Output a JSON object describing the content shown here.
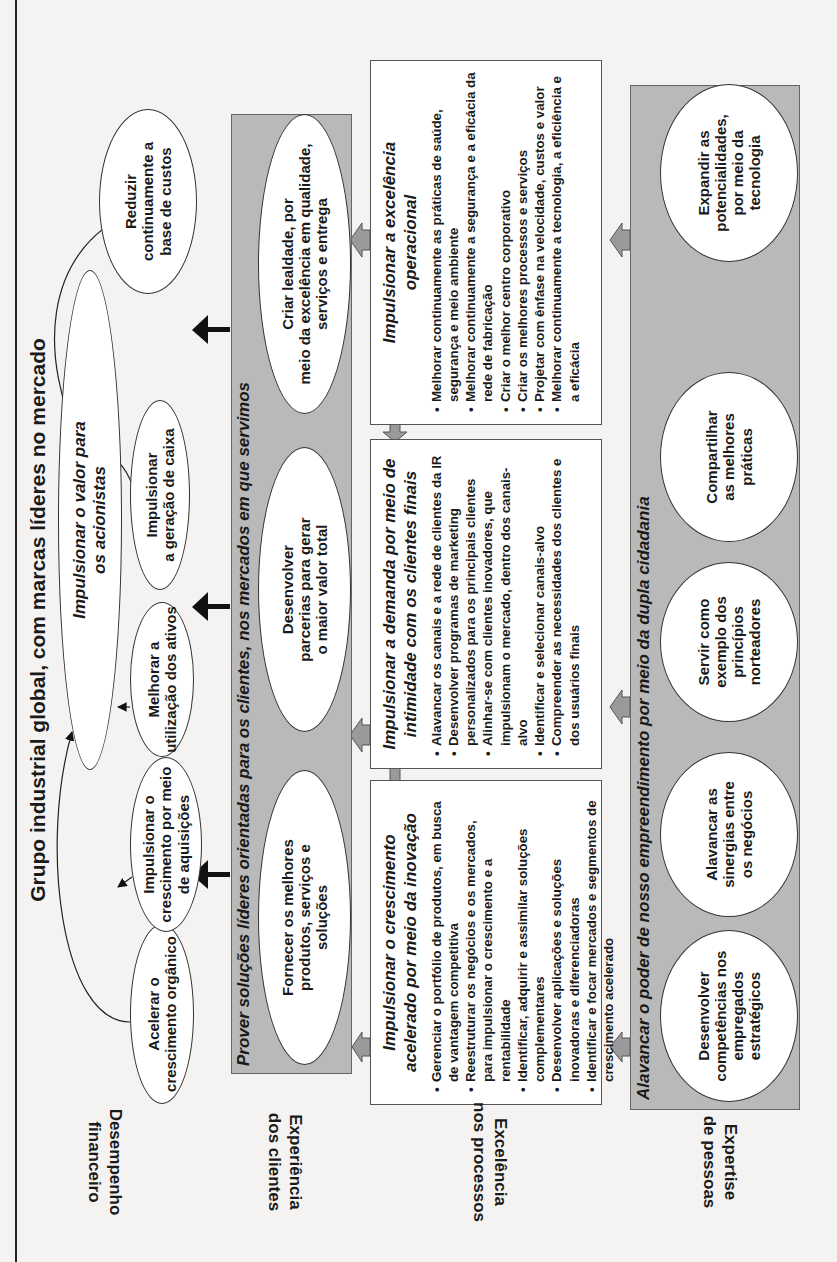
{
  "title": "Grupo industrial global, com marcas líderes no mercado",
  "perspectives": {
    "financial": [
      "Desempenho",
      "financeiro"
    ],
    "customer": [
      "Experiência",
      "dos clientes"
    ],
    "process": [
      "Excelência",
      "nos processos"
    ],
    "people": [
      "Expertise",
      "de pessoas"
    ]
  },
  "financial": {
    "central": [
      "Impulsionar o valor para",
      "os acionistas"
    ],
    "objectives": [
      [
        "Acelerar o",
        "crescimento orgânico"
      ],
      [
        "Impulsionar o",
        "crescimento por meio",
        "de aquisições"
      ],
      [
        "Melhorar a",
        "utilização dos ativos"
      ],
      [
        "Impulsionar",
        "a geração de caixa"
      ],
      [
        "Reduzir",
        "continuamente a",
        "base de custos"
      ]
    ]
  },
  "customer": {
    "band_title": "Prover soluções líderes orientadas para os clientes, nos mercados em que servimos",
    "objectives": [
      [
        "Fornecer os melhores",
        "produtos, serviços e",
        "soluções"
      ],
      [
        "Desenvolver",
        "parcerias para gerar",
        "o maior valor total"
      ],
      [
        "Criar lealdade, por",
        "meio da excelência em qualidade,",
        "serviços e entrega"
      ]
    ]
  },
  "process": {
    "boxes": [
      {
        "title": [
          "Impulsionar o crescimento",
          "acelerado por meio da inovação"
        ],
        "items": [
          "Gerenciar o portfólio de produtos, em busca de vantagem competitiva",
          "Reestruturar os negócios e os mercados, para impulsionar o crescimento e a rentabilidade",
          "Identificar, adquirir e assimilar soluções complementares",
          "Desenvolver aplicações e soluções inovadoras e diferenciadoras",
          "Identificar e focar mercados e segmentos de crescimento acelerado"
        ]
      },
      {
        "title": [
          "Impulsionar a demanda por meio de",
          "intimidade com os clientes finais"
        ],
        "items": [
          "Alavancar os canais e a rede de clientes da IR",
          "Desenvolver programas de marketing personalizados para os principais clientes",
          "Alinhar-se com clientes inovadores, que impulsionam o mercado, dentro dos canais-alvo",
          "Identificar e selecionar canais-alvo",
          "Compreender as necessidades dos clientes e dos usuários finais"
        ]
      },
      {
        "title": [
          "Impulsionar a excelência",
          "operacional"
        ],
        "items": [
          "Melhorar continuamente as práticas de saúde, segurança e meio ambiente",
          "Melhorar continuamente a segurança e a eficácia da rede de fabricação",
          "Criar o melhor centro corporativo",
          "Criar os melhores processos e serviços",
          "Projetar com ênfase na velocidade, custos e valor",
          "Melhorar continuamente a tecnologia, a eficiência e a eficácia"
        ]
      }
    ]
  },
  "people": {
    "band_title": "Alavancar o poder de nosso empreendimento por meio da dupla cidadania",
    "objectives": [
      [
        "Desenvolver",
        "competências nos",
        "empregados",
        "estratégicos"
      ],
      [
        "Alavancar as",
        "sinergias entre",
        "os negócios"
      ],
      [
        "Servir como",
        "exemplo dos",
        "princípios",
        "norteadores"
      ],
      [
        "Compartilhar",
        "as melhores",
        "práticas"
      ],
      [
        "Expandir as",
        "potencialidades,",
        "por meio da",
        "tecnologia"
      ]
    ]
  }
}
